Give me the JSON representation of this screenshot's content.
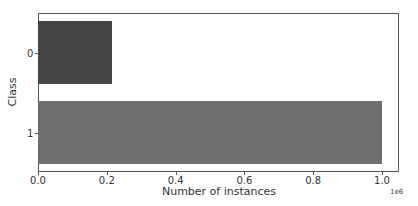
{
  "chart_data": {
    "type": "bar",
    "orientation": "horizontal",
    "title": "",
    "xlabel": "Number of instances",
    "ylabel": "Class",
    "categories": [
      "0",
      "1"
    ],
    "values": [
      215000,
      1000000
    ],
    "bar_colors": [
      "#454545",
      "#6e6e6e"
    ],
    "xlim": [
      0,
      1050000
    ],
    "x_ticks": [
      0.0,
      0.2,
      0.4,
      0.6,
      0.8,
      1.0
    ],
    "x_tick_labels": [
      "0.0",
      "0.2",
      "0.4",
      "0.6",
      "0.8",
      "1.0"
    ],
    "x_offset_label": "1e6",
    "grid": false,
    "legend": null
  }
}
